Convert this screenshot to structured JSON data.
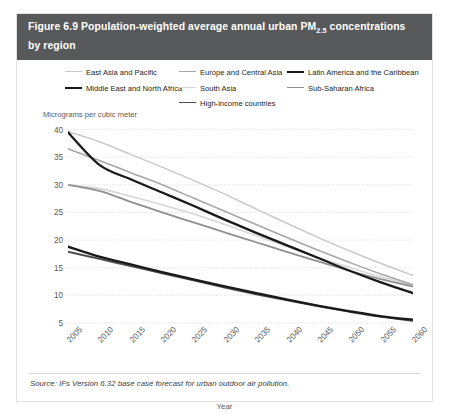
{
  "figure": {
    "title_prefix": "Figure 6.9 Population-weighted average annual urban PM",
    "title_sub": "2.5",
    "title_suffix": " concentrations by region",
    "source": "Source: IFs Version 6.32 base case forecast for urban outdoor air pollution.",
    "header_bg": "#58595b"
  },
  "chart_data": {
    "type": "line",
    "title": "Figure 6.9 Population-weighted average annual urban PM2.5 concentrations by region",
    "xlabel": "Year",
    "ylabel": "Micrograms per cubic meter",
    "grid": true,
    "legend_position": "top",
    "xlim": [
      2005,
      2060
    ],
    "ylim": [
      3,
      41
    ],
    "yticks": [
      40,
      35,
      30,
      25,
      20,
      15,
      10,
      5
    ],
    "x": [
      2005,
      2010,
      2015,
      2020,
      2025,
      2030,
      2035,
      2040,
      2045,
      2050,
      2055,
      2060
    ],
    "xticklabels": [
      "2005",
      "2010",
      "2015",
      "2020",
      "2025",
      "2030",
      "2035",
      "2040",
      "2045",
      "2050",
      "2055",
      "2060"
    ],
    "series": [
      {
        "name": "East Asia and Pacific",
        "color": "#c9c9c9",
        "width": 1.5,
        "values": [
          39.6,
          37.8,
          35.5,
          33.2,
          30.8,
          28.3,
          25.6,
          23.0,
          20.4,
          18.0,
          15.7,
          13.6
        ]
      },
      {
        "name": "Middle East and North Africa",
        "color": "#1a1a1a",
        "width": 2.3,
        "values": [
          39.5,
          33.6,
          31.0,
          28.6,
          26.2,
          23.7,
          21.3,
          19.0,
          16.7,
          14.4,
          12.3,
          10.4
        ]
      },
      {
        "name": "Europe and Central Asia",
        "color": "#a7a7a7",
        "width": 1.6,
        "values": [
          36.5,
          34.4,
          32.2,
          30.0,
          27.6,
          25.2,
          22.8,
          20.4,
          18.1,
          15.9,
          13.8,
          11.9
        ]
      },
      {
        "name": "South Asia",
        "color": "#d6d6d6",
        "width": 1.6,
        "values": [
          30.0,
          29.3,
          27.9,
          26.4,
          24.7,
          22.8,
          20.8,
          18.8,
          16.8,
          15.0,
          13.3,
          11.8
        ]
      },
      {
        "name": "Latin America and the Caribbean",
        "color": "#1a1a1a",
        "width": 2.3,
        "values": [
          18.8,
          17.0,
          15.6,
          14.2,
          12.9,
          11.6,
          10.4,
          9.2,
          8.1,
          7.1,
          6.2,
          5.6
        ]
      },
      {
        "name": "Sub-Saharan Africa",
        "color": "#8f8f8f",
        "width": 1.8,
        "values": [
          30.0,
          28.9,
          26.9,
          25.0,
          23.2,
          21.4,
          19.6,
          17.8,
          16.1,
          14.4,
          12.9,
          11.6
        ]
      },
      {
        "name": "High-income countries",
        "color": "#4d4d4d",
        "width": 2.0,
        "values": [
          17.9,
          16.6,
          15.3,
          14.0,
          12.7,
          11.4,
          10.2,
          9.1,
          8.0,
          7.0,
          6.1,
          5.4
        ]
      }
    ]
  }
}
